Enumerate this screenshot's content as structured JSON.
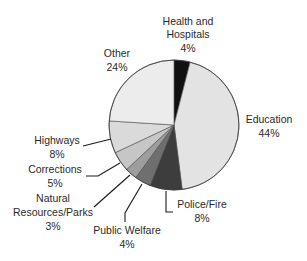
{
  "chart_data": {
    "type": "pie",
    "title": "",
    "unit": "%",
    "slices": [
      {
        "label": "Health and Hospitals",
        "value": 4,
        "display": "4%",
        "color": "#111111"
      },
      {
        "label": "Education",
        "value": 44,
        "display": "44%",
        "color": "#e3e3e3"
      },
      {
        "label": "Police/Fire",
        "value": 8,
        "display": "8%",
        "color": "#3d3d3d"
      },
      {
        "label": "Public Welfare",
        "value": 4,
        "display": "4%",
        "color": "#6f6f6f"
      },
      {
        "label": "Natural Resources/Parks",
        "value": 3,
        "display": "3%",
        "color": "#9d9d9d"
      },
      {
        "label": "Corrections",
        "value": 5,
        "display": "5%",
        "color": "#c6c6c6"
      },
      {
        "label": "Highways",
        "value": 8,
        "display": "8%",
        "color": "#dadada"
      },
      {
        "label": "Other",
        "value": 24,
        "display": "24%",
        "color": "#ececec"
      }
    ],
    "start_direction": "top",
    "order": "clockwise",
    "legend": "none (direct labels)"
  },
  "labels": {
    "health": {
      "lines": [
        "Health and",
        "Hospitals"
      ],
      "pct": "4%"
    },
    "education": {
      "lines": [
        "Education"
      ],
      "pct": "44%"
    },
    "police": {
      "lines": [
        "Police/Fire"
      ],
      "pct": "8%"
    },
    "welfare": {
      "lines": [
        "Public Welfare"
      ],
      "pct": "4%"
    },
    "natural": {
      "lines": [
        "Natural",
        "Resources/Parks"
      ],
      "pct": "3%"
    },
    "corrections": {
      "lines": [
        "Corrections"
      ],
      "pct": "5%"
    },
    "highways": {
      "lines": [
        "Highways"
      ],
      "pct": "8%"
    },
    "other": {
      "lines": [
        "Other"
      ],
      "pct": "24%"
    }
  }
}
